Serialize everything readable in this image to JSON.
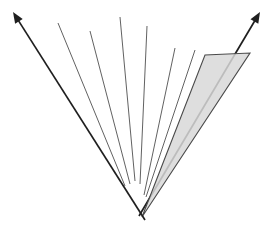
{
  "canvas": {
    "width": 270,
    "height": 229,
    "background": "#ffffff"
  },
  "diagram": {
    "kind": "fan-of-rays-from-apex",
    "apex": {
      "x": 139,
      "y": 216
    },
    "colors": {
      "thin_line": "#4f4f4f",
      "arrow_line": "#1f1f1f",
      "wedge_fill": "#d8d8d8",
      "wedge_stroke": "#4a4a4a"
    },
    "arrows": [
      {
        "name": "left-arrow",
        "from": [
          145,
          220
        ],
        "to": [
          13,
          12
        ],
        "stroke_width": 1.7,
        "head_length": 11,
        "head_half_width": 4.5,
        "layer": "over"
      },
      {
        "name": "right-arrow",
        "from": [
          139,
          216
        ],
        "to": [
          260,
          12
        ],
        "stroke_width": 1.7,
        "head_length": 11,
        "head_half_width": 4.5,
        "layer": "under-wedge"
      }
    ],
    "wedge": {
      "name": "shaded-wedge",
      "points": [
        [
          142,
          217
        ],
        [
          205,
          55
        ],
        [
          250,
          53
        ]
      ],
      "fill_opacity": 0.85,
      "stroke_width": 1.1
    },
    "thin_lines": [
      {
        "name": "fan-line-1",
        "from": [
          58,
          23
        ],
        "to": [
          125,
          186
        ],
        "stroke_width": 0.9
      },
      {
        "name": "fan-line-2",
        "from": [
          90,
          31
        ],
        "to": [
          130,
          184
        ],
        "stroke_width": 0.9
      },
      {
        "name": "fan-line-3",
        "from": [
          120,
          17
        ],
        "to": [
          135,
          181
        ],
        "stroke_width": 0.9
      },
      {
        "name": "fan-line-4",
        "from": [
          147,
          26
        ],
        "to": [
          140,
          184
        ],
        "stroke_width": 0.9
      },
      {
        "name": "fan-line-5",
        "from": [
          175,
          48
        ],
        "to": [
          144,
          195
        ],
        "stroke_width": 0.9
      },
      {
        "name": "fan-line-6",
        "from": [
          195,
          50
        ],
        "to": [
          146,
          197
        ],
        "stroke_width": 0.9
      }
    ]
  }
}
